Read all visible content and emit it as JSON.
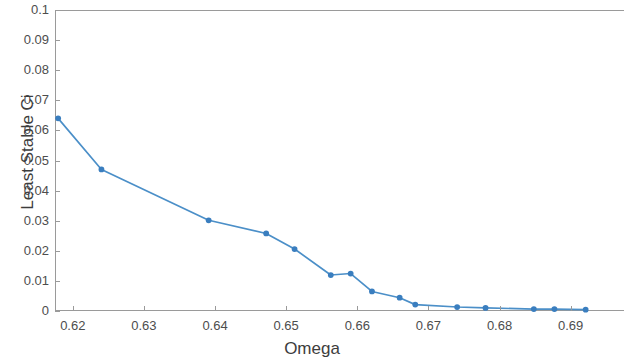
{
  "chart_data": {
    "type": "line",
    "title": "",
    "xlabel": "Omega",
    "ylabel": "Least Stable Ci",
    "xlim": [
      0.6175,
      0.6975
    ],
    "ylim": [
      0,
      0.1
    ],
    "xticks": [
      0.62,
      0.63,
      0.64,
      0.65,
      0.66,
      0.67,
      0.68,
      0.69
    ],
    "xtick_labels": [
      "0.62",
      "0.63",
      "0.64",
      "0.65",
      "0.66",
      "0.67",
      "0.68",
      "0.69"
    ],
    "yticks": [
      0,
      0.01,
      0.02,
      0.03,
      0.04,
      0.05,
      0.06,
      0.07,
      0.08,
      0.09,
      0.1
    ],
    "ytick_labels": [
      "0",
      "0.01",
      "0.02",
      "0.03",
      "0.04",
      "0.05",
      "0.06",
      "0.07",
      "0.08",
      "0.09",
      "0.1"
    ],
    "grid": false,
    "legend": null,
    "line_color": "#4b8fc8",
    "marker": "circle",
    "marker_color": "#3a7ebf",
    "series": [
      {
        "name": "Least Stable Ci",
        "x": [
          0.6178,
          0.6239,
          0.639,
          0.6471,
          0.6511,
          0.6562,
          0.659,
          0.662,
          0.6659,
          0.6681,
          0.674,
          0.678,
          0.6848,
          0.6877,
          0.6921
        ],
        "y": [
          0.0641,
          0.047,
          0.03,
          0.0256,
          0.0204,
          0.0117,
          0.0122,
          0.0062,
          0.0041,
          0.0018,
          0.001,
          0.0007,
          0.0003,
          0.0003,
          0.0001
        ]
      }
    ]
  },
  "figure": {
    "background": "#ffffff",
    "axis_color": "#9a9a9a",
    "tick_label_color": "#4d4d4d",
    "axis_title_color": "#3d3d3d"
  }
}
